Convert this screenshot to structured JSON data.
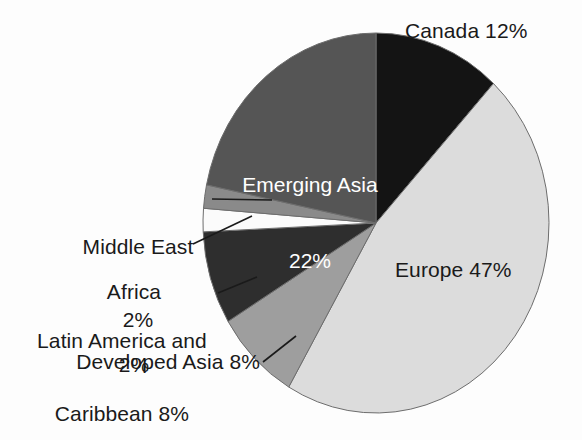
{
  "chart_data": {
    "type": "pie",
    "title": "",
    "total_pct": 101,
    "start_angle_deg": 0,
    "direction": "clockwise",
    "legend": "none",
    "labels_inline": true,
    "categories": [
      "Canada",
      "Europe",
      "Developed Asia",
      "Latin America and Caribbean",
      "Africa",
      "Middle East",
      "Emerging Asia"
    ],
    "values": [
      12,
      47,
      8,
      8,
      2,
      2,
      22
    ],
    "unit": "%",
    "colors": [
      "#141414",
      "#dcdcdc",
      "#9e9e9e",
      "#2e2e2e",
      "#fbfbfb",
      "#8a8a8a",
      "#555555"
    ],
    "slices": [
      {
        "name": "Canada",
        "value": 12,
        "label": "Canada 12%",
        "color": "#141414",
        "label_placement": "outside-right",
        "label_color": "#1a1a1a",
        "leader_line": false
      },
      {
        "name": "Europe",
        "value": 47,
        "label": "Europe 47%",
        "color": "#dcdcdc",
        "label_placement": "inside",
        "label_color": "#1a1a1a",
        "leader_line": false
      },
      {
        "name": "Developed Asia",
        "value": 8,
        "label": "Developed Asia 8%",
        "color": "#9e9e9e",
        "label_placement": "outside-left",
        "label_color": "#1a1a1a",
        "leader_line": true
      },
      {
        "name": "Latin America and Caribbean",
        "value": 8,
        "label_line1": "Latin America and",
        "label_line2": "Caribbean 8%",
        "color": "#2e2e2e",
        "label_placement": "outside-left",
        "label_color": "#1a1a1a",
        "leader_line": true
      },
      {
        "name": "Africa",
        "value": 2,
        "label_line1": "Africa",
        "label_line2": "2%",
        "color": "#fbfbfb",
        "label_placement": "outside-left",
        "label_color": "#1a1a1a",
        "leader_line": true
      },
      {
        "name": "Middle East",
        "value": 2,
        "label_line1": "Middle East",
        "label_line2": "2%",
        "color": "#8a8a8a",
        "label_placement": "outside-left",
        "label_color": "#1a1a1a",
        "leader_line": true
      },
      {
        "name": "Emerging Asia",
        "value": 22,
        "label_line1": "Emerging Asia",
        "label_line2": "22%",
        "color": "#555555",
        "label_placement": "inside",
        "label_color": "#ffffff",
        "leader_line": false
      }
    ]
  },
  "labels": {
    "canada": "Canada 12%",
    "europe": "Europe 47%",
    "emerging_asia_line1": "Emerging Asia",
    "emerging_asia_line2": "22%",
    "middle_east_line1": "Middle East",
    "middle_east_line2": "2%",
    "africa_line1": "Africa",
    "africa_line2": "2%",
    "latin_america_line1": "Latin America and",
    "latin_america_line2": "Caribbean 8%",
    "developed_asia": "Developed Asia 8%"
  }
}
